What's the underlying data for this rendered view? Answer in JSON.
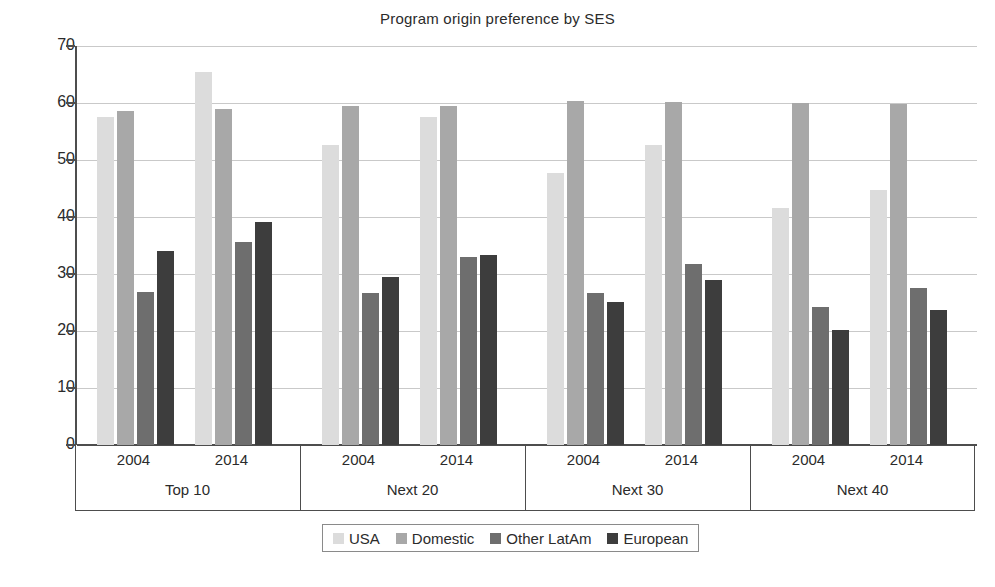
{
  "chart_data": {
    "type": "bar",
    "title": "Program origin preference by SES",
    "xlabel": "",
    "ylabel": "",
    "ylim": [
      0,
      70
    ],
    "ytick_step": 10,
    "yticks": [
      70,
      60,
      50,
      40,
      30,
      20,
      10,
      0
    ],
    "grid": true,
    "legend_position": "bottom",
    "groups": [
      "Top 10",
      "Next 20",
      "Next 30",
      "Next 40"
    ],
    "subcategories": [
      "2004",
      "2014"
    ],
    "categories": [
      "Top 10 2004",
      "Top 10 2014",
      "Next 20 2004",
      "Next 20 2014",
      "Next 30 2004",
      "Next 30 2014",
      "Next 40 2004",
      "Next 40 2014"
    ],
    "series": [
      {
        "name": "USA",
        "color": "#dcdcdc",
        "values": [
          57.6,
          65.5,
          52.6,
          57.6,
          47.8,
          52.6,
          41.5,
          44.8
        ]
      },
      {
        "name": "Domestic",
        "color": "#a8a8a8",
        "values": [
          58.6,
          59.0,
          59.5,
          59.4,
          60.3,
          60.2,
          60.0,
          59.9
        ]
      },
      {
        "name": "Other LatAm",
        "color": "#6e6e6e",
        "values": [
          26.9,
          35.6,
          26.6,
          32.9,
          26.6,
          31.7,
          24.3,
          27.6
        ]
      },
      {
        "name": "European",
        "color": "#3d3d3d",
        "values": [
          34.1,
          39.2,
          29.5,
          33.3,
          25.1,
          29.0,
          20.2,
          23.6
        ]
      }
    ]
  },
  "legend": {
    "items": [
      {
        "label": "USA",
        "color": "#dcdcdc"
      },
      {
        "label": "Domestic",
        "color": "#a8a8a8"
      },
      {
        "label": "Other LatAm",
        "color": "#6e6e6e"
      },
      {
        "label": "European",
        "color": "#3d3d3d"
      }
    ]
  },
  "axis": {
    "y_tick_labels": [
      "70",
      "60",
      "50",
      "40",
      "30",
      "20",
      "10",
      "0"
    ]
  }
}
